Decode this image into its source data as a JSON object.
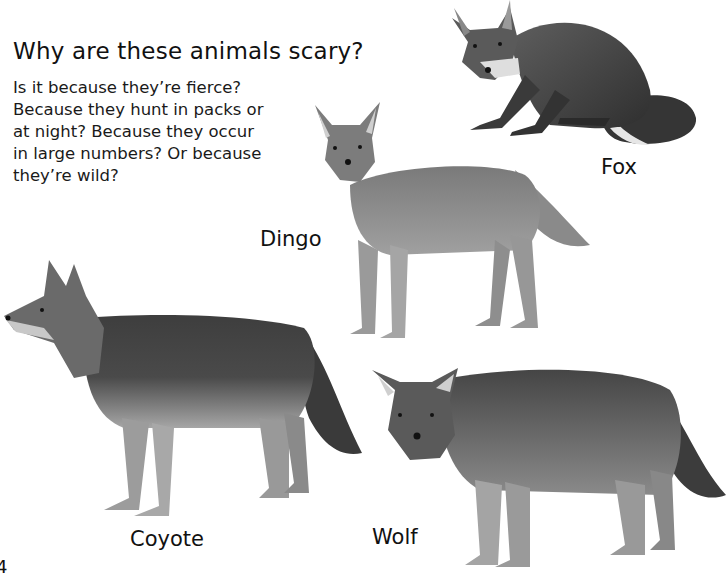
{
  "page": {
    "title": "Why are these animals scary?",
    "intro_lines": [
      "Is it because they’re fierce?",
      "Because they hunt in packs or",
      "at night? Because they occur",
      "in large numbers? Or because",
      "they’re wild?"
    ],
    "page_number": "4"
  },
  "animals": [
    {
      "name": "Fox",
      "label": "Fox"
    },
    {
      "name": "Dingo",
      "label": "Dingo"
    },
    {
      "name": "Coyote",
      "label": "Coyote"
    },
    {
      "name": "Wolf",
      "label": "Wolf"
    }
  ],
  "colors": {
    "background": "#ffffff",
    "text": "#111111",
    "fur_dark": "#3c3c3c",
    "fur_mid": "#6e6e6e",
    "fur_light": "#a8a8a8",
    "fur_pale": "#d8d8d8"
  }
}
